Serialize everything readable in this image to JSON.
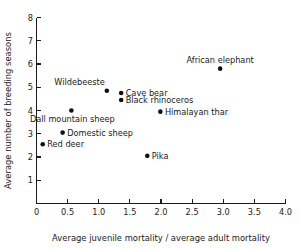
{
  "chart_data": {
    "type": "scatter",
    "title": "",
    "xlabel": "Average juvenile mortality / average adult mortality",
    "ylabel": "Average number of breeding seasons",
    "xlim": [
      0,
      4.0
    ],
    "ylim": [
      0,
      8
    ],
    "grid": false,
    "legend": "none",
    "xticks": [
      "0",
      "0.5",
      "1.0",
      "1.5",
      "2.0",
      "2.5",
      "3.0",
      "3.5",
      "4.0"
    ],
    "xtick_values": [
      0,
      0.5,
      1.0,
      1.5,
      2.0,
      2.5,
      3.0,
      3.5,
      4.0
    ],
    "yticks": [
      "1",
      "2",
      "3",
      "4",
      "5",
      "6",
      "7",
      "8"
    ],
    "ytick_values": [
      1,
      2,
      3,
      4,
      5,
      6,
      7,
      8
    ],
    "points": [
      {
        "label": "African elephant",
        "x": 2.95,
        "y": 5.8,
        "label_pos": "above"
      },
      {
        "label": "Cave bear",
        "x": 1.36,
        "y": 4.75,
        "label_pos": "right"
      },
      {
        "label": "Wildebeeste",
        "x": 1.13,
        "y": 4.85,
        "label_pos": "above-left"
      },
      {
        "label": "Black rhinoceros",
        "x": 1.36,
        "y": 4.45,
        "label_pos": "right"
      },
      {
        "label": "Dall mountain sheep",
        "x": 0.56,
        "y": 4.0,
        "label_pos": "below-left"
      },
      {
        "label": "Himalayan thar",
        "x": 1.99,
        "y": 3.95,
        "label_pos": "right"
      },
      {
        "label": "Domestic sheep",
        "x": 0.42,
        "y": 3.05,
        "label_pos": "right"
      },
      {
        "label": "Red deer",
        "x": 0.1,
        "y": 2.55,
        "label_pos": "right"
      },
      {
        "label": "Pika",
        "x": 1.78,
        "y": 2.05,
        "label_pos": "right"
      }
    ]
  }
}
